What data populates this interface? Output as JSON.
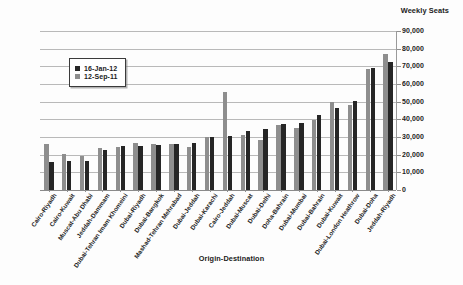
{
  "chart_data": {
    "type": "bar",
    "title": "Weekly Seats",
    "xlabel": "Origin-Destination",
    "ylabel": "Weekly Seats",
    "ylim": [
      0,
      90000
    ],
    "ytick_step": 10000,
    "grid": true,
    "legend_position": "inside-upper-left",
    "ytick_labels": [
      "90,000",
      "80,000",
      "70,000",
      "60,000",
      "50,000",
      "40,000",
      "30,000",
      "20,000",
      "10,000",
      "0"
    ],
    "ytick_values": [
      90000,
      80000,
      70000,
      60000,
      50000,
      40000,
      30000,
      20000,
      10000,
      0
    ],
    "categories": [
      "Cairo-Riyadh",
      "Cairo-Kuwait",
      "Muscat-Abu Dhabi",
      "Jeddah-Dammam",
      "Dubai-Tehran Imam Khomeini",
      "Dubai-Riyadh",
      "Dubai-Bangkok",
      "Mashad-Tehran Mehrabad",
      "Dubai-Jeddah",
      "Dubai-Karachi",
      "Cairo-Jeddah",
      "Dubai-Muscat",
      "Dubai-Delhi",
      "Doha-Bahrain",
      "Dubai-Mumbai",
      "Dubai-Bahrain",
      "Dubai-Kuwait",
      "Dubai-London Heathrow",
      "Dubai-Doha",
      "Jeddah-Riyadh"
    ],
    "series": [
      {
        "name": "16-Jan-12",
        "color": "#262626",
        "values": [
          15800,
          16400,
          16700,
          22800,
          24700,
          25000,
          25700,
          25900,
          26400,
          29900,
          30500,
          33600,
          34500,
          37500,
          37700,
          42600,
          46600,
          50400,
          69000,
          72700
        ]
      },
      {
        "name": "12-Sep-11",
        "color": "#8e8e8e",
        "values": [
          26000,
          20200,
          19400,
          24000,
          24200,
          26700,
          25800,
          25900,
          24200,
          29900,
          55500,
          31300,
          28300,
          36800,
          35300,
          39800,
          49800,
          48200,
          68500,
          77000
        ]
      }
    ]
  },
  "legend": {
    "entries": [
      {
        "label": "16-Jan-12"
      },
      {
        "label": "12-Sep-11"
      }
    ]
  }
}
